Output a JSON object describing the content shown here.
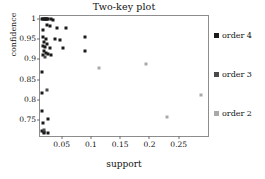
{
  "chart_data": {
    "type": "scatter",
    "title": "Two-key plot",
    "xlabel": "support",
    "ylabel": "confidence",
    "xlim": [
      0.013,
      0.3
    ],
    "ylim": [
      0.71,
      1.008
    ],
    "xticks": [
      0.05,
      0.1,
      0.15,
      0.2,
      0.25
    ],
    "xtick_labels": [
      "0.05",
      "0.1",
      "0.15",
      "0.2",
      "0.25"
    ],
    "yticks": [
      0.75,
      0.8,
      0.85,
      0.9,
      0.95,
      1
    ],
    "ytick_labels": [
      "0.75",
      "0.8",
      "0.85",
      "0.9",
      "0.95",
      "1"
    ],
    "grid": false,
    "legend_position": "right",
    "series": [
      {
        "name": "order 4",
        "color": "#1b1b1b",
        "points": [
          [
            0.0165,
            1.0
          ],
          [
            0.018,
            1.0
          ],
          [
            0.0195,
            1.0
          ],
          [
            0.021,
            1.0
          ],
          [
            0.0225,
            1.0
          ],
          [
            0.024,
            1.0
          ],
          [
            0.0255,
            1.0
          ],
          [
            0.0275,
            1.0
          ],
          [
            0.0315,
            1.0
          ],
          [
            0.0345,
            0.999
          ],
          [
            0.0175,
            0.972
          ],
          [
            0.0255,
            0.985
          ],
          [
            0.0305,
            0.982
          ],
          [
            0.0425,
            0.978
          ],
          [
            0.058,
            0.979
          ],
          [
            0.0185,
            0.955
          ],
          [
            0.0225,
            0.952
          ],
          [
            0.0205,
            0.944
          ],
          [
            0.0385,
            0.951
          ],
          [
            0.0465,
            0.949
          ],
          [
            0.0905,
            0.957
          ],
          [
            0.0185,
            0.934
          ],
          [
            0.0215,
            0.931
          ],
          [
            0.0255,
            0.938
          ],
          [
            0.0305,
            0.929
          ],
          [
            0.0525,
            0.928
          ],
          [
            0.0195,
            0.921
          ],
          [
            0.0225,
            0.917
          ],
          [
            0.0175,
            0.912
          ],
          [
            0.0265,
            0.913
          ],
          [
            0.0315,
            0.911
          ],
          [
            0.0895,
            0.921
          ],
          [
            0.0165,
            0.869
          ],
          [
            0.0165,
            0.816
          ],
          [
            0.0165,
            0.772
          ],
          [
            0.0265,
            0.751
          ],
          [
            0.0175,
            0.742
          ],
          [
            0.0165,
            0.722
          ],
          [
            0.019,
            0.718
          ],
          [
            0.0205,
            0.719
          ],
          [
            0.0265,
            0.718
          ]
        ]
      },
      {
        "name": "order 3",
        "color": "#4a4a4a",
        "points": [
          [
            0.0215,
            0.906
          ],
          [
            0.0245,
            0.823
          ],
          [
            0.0205,
            0.726
          ]
        ]
      },
      {
        "name": "order 2",
        "color": "#a9a9a9",
        "points": [
          [
            0.1145,
            0.88
          ],
          [
            0.1935,
            0.888
          ],
          [
            0.2885,
            0.812
          ],
          [
            0.2295,
            0.758
          ]
        ]
      }
    ]
  },
  "legend": {
    "entries": [
      {
        "label": "order 4",
        "color": "#1b1b1b"
      },
      {
        "label": "order 3",
        "color": "#4a4a4a"
      },
      {
        "label": "order 2",
        "color": "#a9a9a9"
      }
    ]
  }
}
